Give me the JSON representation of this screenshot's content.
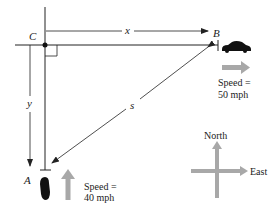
{
  "diagram": {
    "points": {
      "C": "C",
      "B": "B",
      "A": "A"
    },
    "distances": {
      "x": "x",
      "y": "y",
      "s": "s"
    },
    "car_b": {
      "speed_line1": "Speed =",
      "speed_line2": "50 mph",
      "direction": "east"
    },
    "car_a": {
      "speed_line1": "Speed =",
      "speed_line2": "40 mph",
      "direction": "north"
    },
    "compass": {
      "north": "North",
      "east": "East"
    },
    "colors": {
      "line": "#222222",
      "arrow_gray": "#a8a8a8",
      "car": "#111111"
    }
  }
}
